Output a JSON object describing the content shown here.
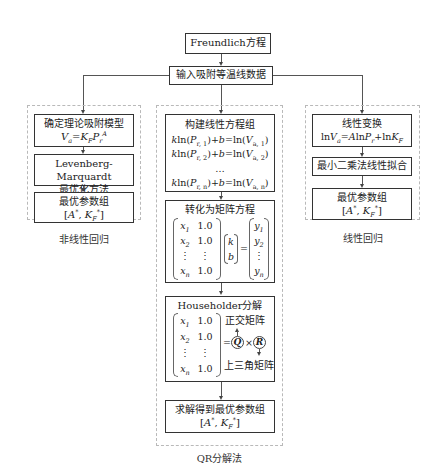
{
  "top": {
    "start": "Freundlich方程",
    "input": "输入吸附等温线数据"
  },
  "left": {
    "group_label": "非线性回归",
    "box1_title": "确定理论吸附模型",
    "box1_formula": "Va=KFPr^A",
    "box2_line1": "Levenberg-Marquardt",
    "box2_line2": "最优化方法",
    "box3_title": "最优参数组",
    "box3_params": "[A*, KF*]"
  },
  "middle": {
    "group_label": "QR分解法",
    "box1_title": "构建线性方程组",
    "box1_eqs": [
      "kln(Pr,1)+b=ln(Va,1)",
      "kln(Pr,2)+b=ln(Va,2)",
      "…",
      "kln(Pr,n)+b=ln(Va,n)"
    ],
    "box2_title": "转化为矩阵方程",
    "matrix_x": [
      "x1",
      "x2",
      "⋮",
      "xn"
    ],
    "matrix_c": [
      "1.0",
      "1.0",
      "⋮",
      "1.0"
    ],
    "vector_kb": [
      "k",
      "b"
    ],
    "vector_y": [
      "y1",
      "y2",
      "⋮",
      "yn"
    ],
    "box3_title": "Householder分解",
    "q_label": "Q",
    "r_label": "R",
    "q_desc": "正交矩阵",
    "r_desc": "上三角矩阵",
    "box4_title": "求解得到最优参数组",
    "box4_params": "[A*, KF*]"
  },
  "right": {
    "group_label": "线性回归",
    "box1_title": "线性变换",
    "box1_formula": "lnVa=AlnPr+lnKF",
    "box2_title": "最小二乘法线性拟合",
    "box3_title": "最优参数组",
    "box3_params": "[A*, KF*]"
  }
}
